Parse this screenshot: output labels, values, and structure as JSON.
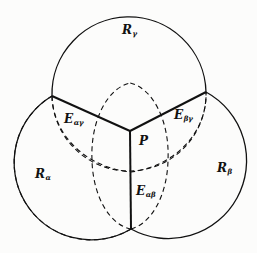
{
  "diagram": {
    "colors": {
      "stroke": "#111111",
      "background": "#fcfcfb"
    },
    "regions": [
      {
        "id": "R_gamma",
        "main": "R",
        "sub": "γ",
        "x": 122,
        "y": 24
      },
      {
        "id": "R_alpha",
        "main": "R",
        "sub": "α",
        "x": 35,
        "y": 168
      },
      {
        "id": "R_beta",
        "main": "R",
        "sub": "β",
        "x": 217,
        "y": 162
      }
    ],
    "edges": [
      {
        "id": "E_alpha_gamma",
        "main": "E",
        "sub": "αγ",
        "x": 66,
        "y": 112
      },
      {
        "id": "E_beta_gamma",
        "main": "E",
        "sub": "βγ",
        "x": 175,
        "y": 108
      },
      {
        "id": "E_alpha_beta",
        "main": "E",
        "sub": "αβ",
        "x": 136,
        "y": 184
      }
    ],
    "point": {
      "id": "P",
      "label": "P",
      "x": 139,
      "y": 134
    },
    "geometry": {
      "solid_circles": [
        {
          "name": "circle-r-gamma",
          "cx": 130,
          "cy": 92,
          "r": 77
        },
        {
          "name": "circle-r-alpha",
          "cx": 83,
          "cy": 161,
          "r": 77
        },
        {
          "name": "circle-r-beta",
          "cx": 171,
          "cy": 161,
          "r": 77
        }
      ],
      "dashed_circles": [
        {
          "name": "dashed-circle-top",
          "cx": 129,
          "cy": 131,
          "rx": 78,
          "ry": 42
        },
        {
          "name": "dashed-circle-left",
          "cx": 130,
          "cy": 163,
          "rx": 38,
          "ry": 67
        },
        {
          "name": "dashed-circle-right",
          "cx": 130,
          "cy": 163,
          "rx": 38,
          "ry": 67
        }
      ],
      "junction_point": {
        "x": 130,
        "y": 131
      },
      "left_junction": {
        "x": 52,
        "y": 96
      },
      "right_junction": {
        "x": 206,
        "y": 92
      },
      "bottom_junction": {
        "x": 131,
        "y": 229
      }
    }
  }
}
